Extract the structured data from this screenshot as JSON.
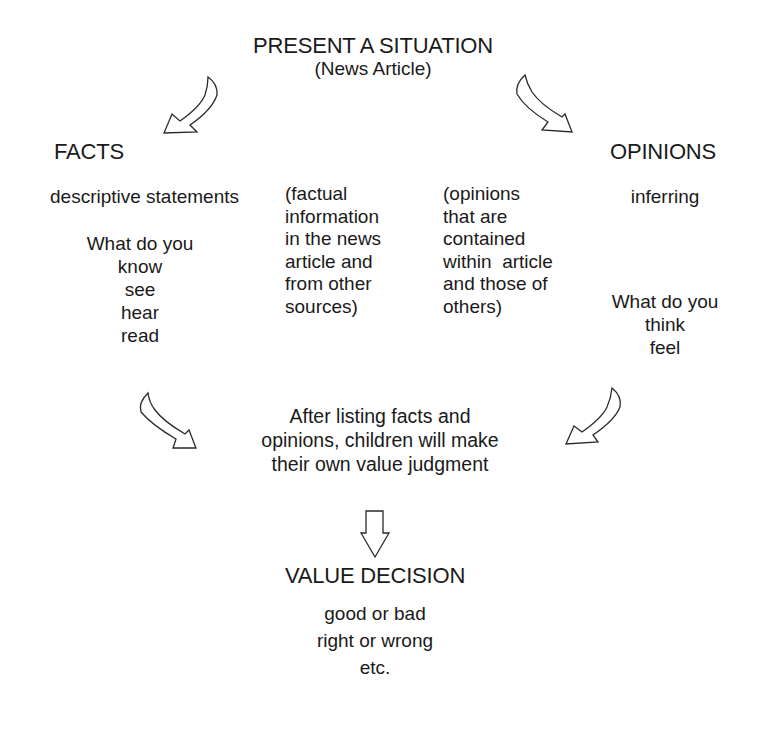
{
  "diagram": {
    "top": {
      "title": "PRESENT A SITUATION",
      "subtitle": "(News Article)"
    },
    "facts": {
      "heading": "FACTS",
      "description": "descriptive statements",
      "prompt_lines": [
        "What do you",
        "know",
        "see",
        "hear",
        "read"
      ]
    },
    "facts_note": {
      "lines": [
        "(factual",
        "information",
        "in the news",
        "article and",
        "from other",
        "sources)"
      ]
    },
    "opinions_note": {
      "lines": [
        "(opinions",
        "that are",
        "contained",
        "within  article",
        "and those of",
        "others)"
      ]
    },
    "opinions": {
      "heading": "OPINIONS",
      "description": "inferring",
      "prompt_lines": [
        "What do you",
        "think",
        "feel"
      ]
    },
    "judgment": {
      "lines": [
        "After listing facts and",
        "opinions, children will make",
        "their own value judgment"
      ]
    },
    "decision": {
      "heading": "VALUE DECISION",
      "lines": [
        "good or bad",
        "right or wrong",
        "etc."
      ]
    },
    "arrows": [
      {
        "id": "top-left",
        "direction": "down-left",
        "icon": "curved-arrow-icon"
      },
      {
        "id": "top-right",
        "direction": "down-right",
        "icon": "curved-arrow-icon"
      },
      {
        "id": "bottom-left",
        "direction": "down-right",
        "icon": "curved-arrow-icon"
      },
      {
        "id": "bottom-right",
        "direction": "down-left",
        "icon": "curved-arrow-icon"
      },
      {
        "id": "center-down",
        "direction": "down",
        "icon": "down-arrow-icon"
      }
    ],
    "colors": {
      "background": "#ffffff",
      "text": "#1a1a1a",
      "arrow_stroke": "#2a2a2a"
    }
  }
}
